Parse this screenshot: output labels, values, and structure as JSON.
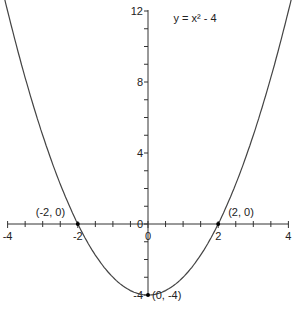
{
  "chart_data": {
    "type": "line",
    "title": "y = x² - 4",
    "function": "x^2 - 4",
    "xlabel": "",
    "ylabel": "",
    "xlim": [
      -4,
      4
    ],
    "ylim": [
      -4,
      12
    ],
    "x_tick_labels": [
      "-4",
      "-2",
      "0",
      "2",
      "4"
    ],
    "y_tick_labels": [
      "12",
      "8",
      "4",
      "0",
      "-4"
    ],
    "grid": false,
    "series": [
      {
        "name": "y = x² - 4",
        "x": [
          -4.2,
          -4,
          -3,
          -2,
          -1,
          0,
          1,
          2,
          3,
          4,
          4.2
        ],
        "y": [
          13.64,
          12,
          5,
          0,
          -3,
          -4,
          -3,
          0,
          5,
          12,
          13.64
        ]
      }
    ],
    "annotations": [
      {
        "label": "(-2, 0)",
        "x": -2,
        "y": 0
      },
      {
        "label": "(2, 0)",
        "x": 2,
        "y": 0
      },
      {
        "label": "(0, -4)",
        "x": 0,
        "y": -4
      }
    ]
  },
  "colors": {
    "curve": "#444444",
    "axis": "#333333",
    "point": "#000000"
  }
}
